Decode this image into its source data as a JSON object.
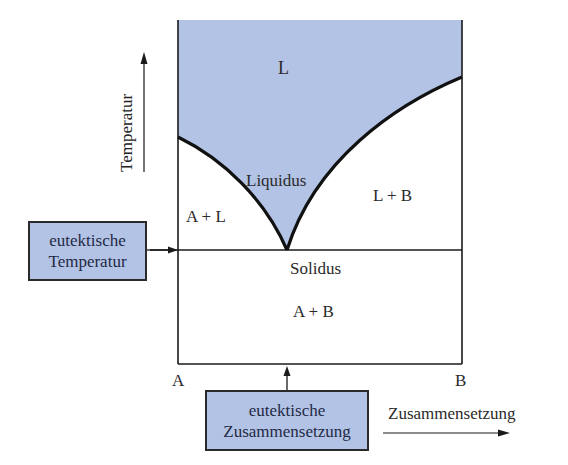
{
  "diagram": {
    "type": "eutectic-phase-diagram",
    "colors": {
      "liquid_region": "#b3c3e6",
      "lines": "#1a1a1a",
      "box_fill": "#b3c3e6"
    },
    "regions": {
      "liquid": "L",
      "liquid_plus_b": "L + B",
      "a_plus_liquid": "A + L",
      "a_plus_b": "A + B"
    },
    "curves": {
      "liquidus": "Liquidus",
      "solidus": "Solidus"
    },
    "axes": {
      "y_label": "Temperatur",
      "x_label": "Zusammensetzung",
      "x_left": "A",
      "x_right": "B"
    },
    "callouts": {
      "eutectic_temperature": {
        "line1": "eutektische",
        "line2": "Temperatur"
      },
      "eutectic_composition": {
        "line1": "eutektische",
        "line2": "Zusammensetzung"
      }
    }
  }
}
